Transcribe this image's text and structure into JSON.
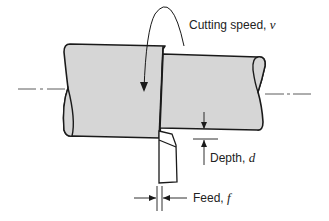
{
  "figure": {
    "type": "turning operation schematic",
    "elements": [
      "workpiece cylinder",
      "cutting tool",
      "rotation arrow",
      "depth dimension",
      "feed dimension",
      "centerline"
    ]
  },
  "labels": {
    "cutting_speed": {
      "text": "Cutting speed, ",
      "var": "v"
    },
    "depth": {
      "text": "Depth, ",
      "var": "d"
    },
    "feed": {
      "text": "Feed, ",
      "var": "f"
    }
  },
  "colors": {
    "workpiece_fill": "#d6d6d6",
    "stroke": "#1a1a1a",
    "background": "#ffffff"
  }
}
